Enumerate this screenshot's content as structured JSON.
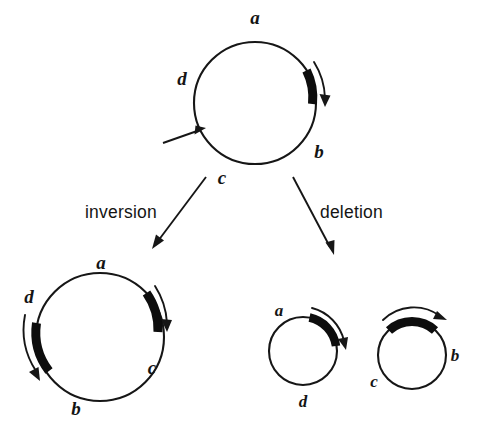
{
  "figure": {
    "background_color": "#ffffff",
    "ink_color": "#161616"
  },
  "parent_circle": {
    "name": "original-circular-genome",
    "labels": {
      "a": "a",
      "b": "b",
      "c": "c",
      "d": "d"
    },
    "marked_segment": {
      "name": "thick-segment",
      "position": "right",
      "direction": "clockwise"
    },
    "breakpoint_pointer": {
      "name": "breakpoint-pointer",
      "position": "lower-left"
    }
  },
  "processes": [
    {
      "key": "inversion",
      "label": "inversion",
      "arrow_direction": "down-left"
    },
    {
      "key": "deletion",
      "label": "deletion",
      "arrow_direction": "down-right"
    }
  ],
  "inversion_product": {
    "name": "inversion-product-circle",
    "labels": {
      "a": "a",
      "b": "b",
      "c": "c",
      "d": "d"
    },
    "segments": [
      {
        "position": "upper-right",
        "direction": "clockwise"
      },
      {
        "position": "left",
        "direction": "counterclockwise"
      }
    ]
  },
  "deletion_products": [
    {
      "name": "deletion-product-circle-left",
      "labels": {
        "a": "a",
        "d": "d"
      },
      "segment": {
        "position": "top-right",
        "direction": "clockwise"
      }
    },
    {
      "name": "deletion-product-circle-right",
      "labels": {
        "b": "b",
        "c": "c"
      },
      "segment": {
        "position": "top",
        "direction": "clockwise"
      }
    }
  ]
}
